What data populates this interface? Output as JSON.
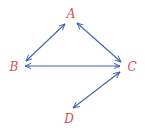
{
  "diagram": {
    "type": "directed-graph",
    "edge_style": "bidirectional-arrows",
    "colors": {
      "edge": "#3b63b8",
      "label": "#e04a55",
      "background": "#ffffff"
    },
    "nodes": [
      {
        "id": "A",
        "label": "A",
        "x": 71,
        "y": 14
      },
      {
        "id": "B",
        "label": "B",
        "x": 14,
        "y": 67
      },
      {
        "id": "C",
        "label": "C",
        "x": 132,
        "y": 67
      },
      {
        "id": "D",
        "label": "D",
        "x": 69,
        "y": 119
      }
    ],
    "edges": [
      {
        "from": "A",
        "to": "B",
        "bidirectional": true,
        "x1": 65,
        "y1": 24,
        "x2": 26,
        "y2": 61
      },
      {
        "from": "A",
        "to": "C",
        "bidirectional": true,
        "x1": 77,
        "y1": 23,
        "x2": 121,
        "y2": 62
      },
      {
        "from": "B",
        "to": "C",
        "bidirectional": true,
        "x1": 25,
        "y1": 66,
        "x2": 120,
        "y2": 66
      },
      {
        "from": "C",
        "to": "D",
        "bidirectional": true,
        "x1": 120,
        "y1": 72,
        "x2": 73,
        "y2": 108
      }
    ]
  }
}
